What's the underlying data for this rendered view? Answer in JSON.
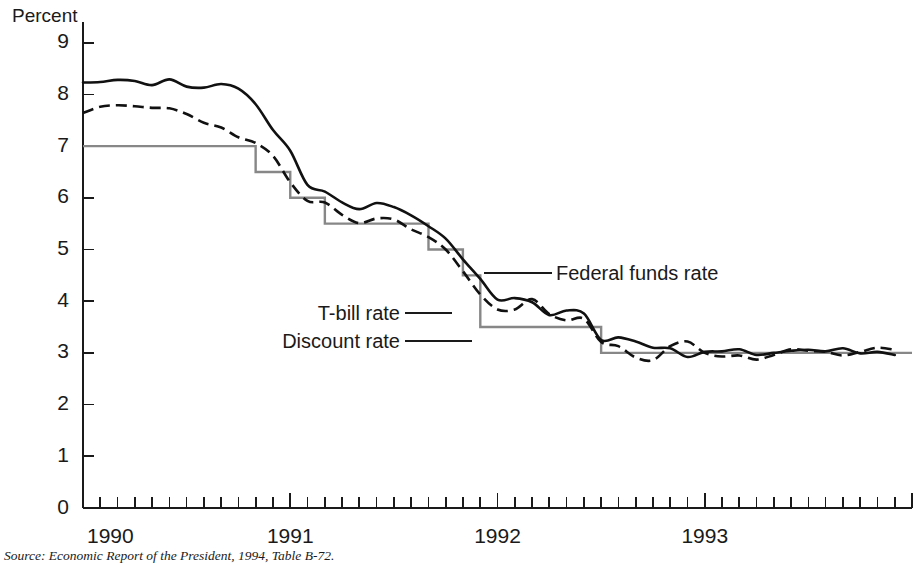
{
  "figure": {
    "axis_title_y": "Percent",
    "source": "Source:  Economic Report of the President, 1994, Table B-72."
  },
  "annotations": {
    "federal_funds": "Federal funds rate",
    "tbill": "T-bill rate",
    "discount": "Discount rate"
  },
  "colors": {
    "federal_funds": "#111111",
    "tbill": "#111111",
    "discount": "#878787",
    "axis": "#1a1a1a",
    "background": "#ffffff"
  },
  "chart_data": {
    "type": "line",
    "title": "",
    "subtitle": "",
    "xlabel": "",
    "ylabel": "Percent",
    "ylim": [
      0,
      9.4
    ],
    "yticks": [
      0,
      1,
      2,
      3,
      4,
      5,
      6,
      7,
      8,
      9
    ],
    "ytick_labels": [
      "0",
      "1",
      "2",
      "3",
      "4",
      "5",
      "6",
      "7",
      "8",
      "9"
    ],
    "xlim": [
      1990.0,
      1994.0
    ],
    "xtick_labels": [
      "1990",
      "1991",
      "1992",
      "1993"
    ],
    "xtick_positions": [
      1990.0,
      1991.0,
      1992.0,
      1993.0
    ],
    "minor_ticks": "monthly",
    "grid": false,
    "legend_position": "inline-annotations",
    "x": [
      1990.0,
      1990.083,
      1990.167,
      1990.25,
      1990.333,
      1990.417,
      1990.5,
      1990.583,
      1990.667,
      1990.75,
      1990.833,
      1990.917,
      1991.0,
      1991.083,
      1991.167,
      1991.25,
      1991.333,
      1991.417,
      1991.5,
      1991.583,
      1991.667,
      1991.75,
      1991.833,
      1991.917,
      1992.0,
      1992.083,
      1992.167,
      1992.25,
      1992.333,
      1992.417,
      1992.5,
      1992.583,
      1992.667,
      1992.75,
      1992.833,
      1992.917,
      1993.0,
      1993.083,
      1993.167,
      1993.25,
      1993.333,
      1993.417,
      1993.5,
      1993.583,
      1993.667,
      1993.75,
      1993.833,
      1993.917
    ],
    "series": [
      {
        "name": "Federal funds rate",
        "style": "solid",
        "color": "#111111",
        "values": [
          8.23,
          8.24,
          8.28,
          8.26,
          8.18,
          8.29,
          8.15,
          8.13,
          8.2,
          8.11,
          7.81,
          7.31,
          6.91,
          6.25,
          6.12,
          5.91,
          5.78,
          5.9,
          5.82,
          5.66,
          5.45,
          5.21,
          4.81,
          4.43,
          4.03,
          4.06,
          3.98,
          3.73,
          3.82,
          3.76,
          3.25,
          3.3,
          3.22,
          3.1,
          3.09,
          2.92,
          3.02,
          3.03,
          3.07,
          2.96,
          3.0,
          3.04,
          3.06,
          3.03,
          3.09,
          2.99,
          3.02,
          2.96
        ]
      },
      {
        "name": "T-bill rate",
        "style": "dashed",
        "color": "#111111",
        "values": [
          7.64,
          7.76,
          7.79,
          7.77,
          7.74,
          7.73,
          7.62,
          7.45,
          7.36,
          7.17,
          7.06,
          6.81,
          6.3,
          5.94,
          5.91,
          5.67,
          5.51,
          5.6,
          5.58,
          5.39,
          5.24,
          5.0,
          4.58,
          4.13,
          3.84,
          3.84,
          4.04,
          3.75,
          3.63,
          3.66,
          3.21,
          3.13,
          2.91,
          2.86,
          3.13,
          3.22,
          3.0,
          2.93,
          2.95,
          2.87,
          2.96,
          3.07,
          3.04,
          3.02,
          2.95,
          3.02,
          3.1,
          3.06
        ]
      },
      {
        "name": "Discount rate",
        "style": "step",
        "color": "#878787",
        "values": [
          7.0,
          7.0,
          7.0,
          7.0,
          7.0,
          7.0,
          7.0,
          7.0,
          7.0,
          7.0,
          6.5,
          6.5,
          6.0,
          6.0,
          5.5,
          5.5,
          5.5,
          5.5,
          5.5,
          5.5,
          5.0,
          5.0,
          4.5,
          3.5,
          3.5,
          3.5,
          3.5,
          3.5,
          3.5,
          3.5,
          3.0,
          3.0,
          3.0,
          3.0,
          3.0,
          3.0,
          3.0,
          3.0,
          3.0,
          3.0,
          3.0,
          3.0,
          3.0,
          3.0,
          3.0,
          3.0,
          3.0,
          3.0
        ]
      }
    ]
  }
}
